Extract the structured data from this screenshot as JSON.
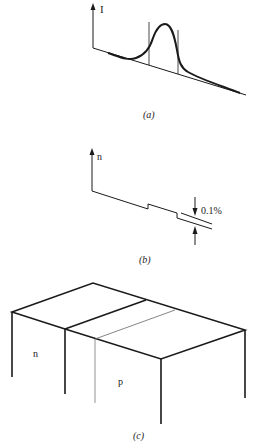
{
  "panels": {
    "a": {
      "caption": "(a)",
      "caption_letter": "a",
      "axis_label": "I",
      "description": "Intensity peak over sloped baseline with two vertical markers bounding the peak"
    },
    "b": {
      "caption": "(b)",
      "caption_letter": "b",
      "axis_label": "n",
      "step_annotation": "0.1%",
      "description": "Stepped refractive index profile with 0.1% offset indicated by opposing arrows"
    },
    "c": {
      "caption": "(c)",
      "caption_letter": "c",
      "region_left_label": "n",
      "region_right_label": "p",
      "description": "3D block showing n-region and p-region"
    }
  },
  "colors": {
    "line": "#1a1a1a",
    "thin_line": "#555555",
    "background": "#ffffff"
  }
}
